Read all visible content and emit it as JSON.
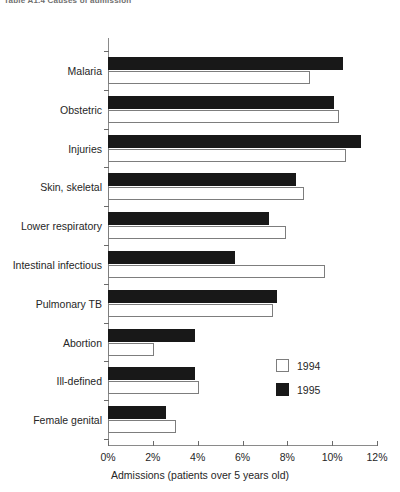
{
  "caption": {
    "text": "Table A1.4  Causes of admission"
  },
  "chart_data": {
    "type": "bar",
    "orientation": "horizontal",
    "title": "",
    "subtitle": "",
    "xlabel": "Admissions (patients over 5 years old)",
    "ylabel": "",
    "xlim": [
      0,
      12
    ],
    "xticks": [
      0,
      2,
      4,
      6,
      8,
      10,
      12
    ],
    "xtick_labels": [
      "0%",
      "2%",
      "4%",
      "6%",
      "8%",
      "10%",
      "12%"
    ],
    "grid": false,
    "legend_position": "middle-right",
    "categories": [
      "Malaria",
      "Obstetric",
      "Injuries",
      "Skin, skeletal",
      "Lower respiratory",
      "Intestinal infectious",
      "Pulmonary TB",
      "Abortion",
      "Ill-defined",
      "Female genital"
    ],
    "series": [
      {
        "name": "1995",
        "color": "#181818",
        "values": [
          10.5,
          10.1,
          11.3,
          8.4,
          7.2,
          5.65,
          7.55,
          3.9,
          3.9,
          2.6
        ]
      },
      {
        "name": "1994",
        "color": "#ffffff",
        "values": [
          9.0,
          10.3,
          10.6,
          8.75,
          7.95,
          9.7,
          7.35,
          2.05,
          4.05,
          3.05
        ]
      }
    ],
    "legend": [
      {
        "label": "1994",
        "swatch": "white"
      },
      {
        "label": "1995",
        "swatch": "black"
      }
    ]
  }
}
